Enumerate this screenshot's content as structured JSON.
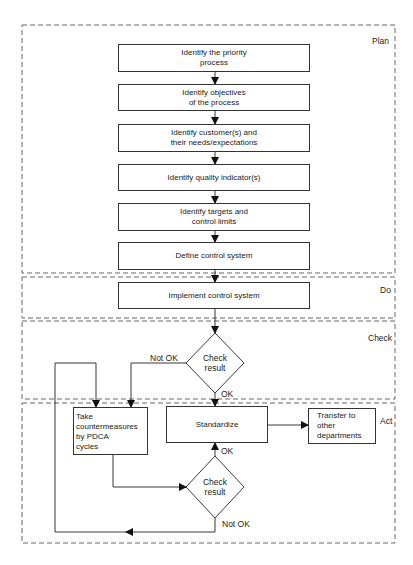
{
  "phases": {
    "plan": "Plan",
    "do": "Do",
    "check": "Check",
    "act": "Act"
  },
  "plan_steps": [
    "Identify the priority\nprocess",
    "Identify objectives\nof the process",
    "Identify customer(s) and\ntheir needs/expectations",
    "Identify quality indicator(s)",
    "Identify targets and\ncontrol limits",
    "Define control system"
  ],
  "do_step": "Implement control system",
  "check_decision": "Check\nresult",
  "act": {
    "countermeasures": "Take\ncountermeasures\nby PDCA\ncycles",
    "standardize": "Standardize",
    "transfer": "Transfer to\nother\ndepartments",
    "check_decision": "Check\nresult"
  },
  "edge_labels": {
    "check_not_ok": "Not OK",
    "check_ok": "OK",
    "act_ok": "OK",
    "act_not_ok": "Not OK"
  }
}
